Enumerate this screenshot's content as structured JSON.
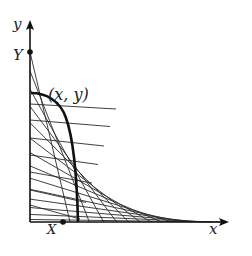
{
  "figure": {
    "type": "envelope-of-lines",
    "colors": {
      "ink": "#1a1a1a",
      "background": "#ffffff"
    }
  },
  "axes": {
    "x_label": "x",
    "y_label": "y"
  },
  "points": {
    "Y": {
      "label": "Y"
    },
    "X": {
      "label": "X"
    },
    "P": {
      "label": "(x, y)"
    }
  }
}
